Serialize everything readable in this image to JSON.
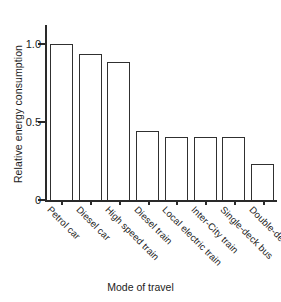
{
  "chart_data": {
    "type": "bar",
    "title": "",
    "xlabel": "Mode of travel",
    "ylabel": "Relative energy consumption",
    "categories": [
      "Petrol car",
      "Diesel car",
      "High speed train",
      "Diesel train",
      "Local electric train",
      "Inter-City train",
      "Single-deck bus",
      "Double-deck bus"
    ],
    "values": [
      1.0,
      0.93,
      0.88,
      0.44,
      0.4,
      0.4,
      0.4,
      0.23
    ],
    "ylim": [
      0,
      1.08
    ],
    "yticks": [
      0,
      0.5,
      1.0
    ],
    "ytick_labels": [
      "0",
      "0.5",
      "1.0"
    ],
    "grid": false,
    "legend": false,
    "bar_face_color": "#ffffff",
    "bar_edge_color": "#303030",
    "axis_color": "#2a2a2a",
    "background_color": "#ffffff",
    "xtick_label_rotation": 45
  }
}
